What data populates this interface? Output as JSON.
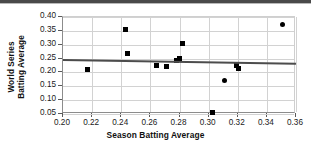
{
  "chart_data": {
    "type": "scatter",
    "title": "",
    "xlabel": "Season Batting Average",
    "ylabel": "World Series Batting Average",
    "ylabel_lines": [
      "World Series",
      "Batting Average"
    ],
    "xlim": [
      0.2,
      0.36
    ],
    "ylim": [
      0.05,
      0.4
    ],
    "xticks": [
      0.2,
      0.22,
      0.24,
      0.26,
      0.28,
      0.3,
      0.32,
      0.34,
      0.36
    ],
    "xtick_labels": [
      "0.20",
      "0.22",
      "0.24",
      "0.26",
      "0.28",
      "0.30",
      "0.32",
      "0.34",
      "0.36"
    ],
    "yticks": [
      0.05,
      0.1,
      0.15,
      0.2,
      0.25,
      0.3,
      0.35,
      0.4
    ],
    "ytick_labels": [
      "0.05",
      "0.10",
      "0.15",
      "0.20",
      "0.25",
      "0.30",
      "0.35",
      "0.40"
    ],
    "grid": true,
    "legend": false,
    "marker_color": "#000000",
    "trendline_color": "#4c4c4c",
    "points": [
      {
        "x": 0.2165,
        "y": 0.212,
        "marker": "square"
      },
      {
        "x": 0.243,
        "y": 0.356,
        "marker": "square"
      },
      {
        "x": 0.244,
        "y": 0.268,
        "marker": "square"
      },
      {
        "x": 0.2645,
        "y": 0.2245,
        "marker": "square"
      },
      {
        "x": 0.271,
        "y": 0.222,
        "marker": "square"
      },
      {
        "x": 0.278,
        "y": 0.243,
        "marker": "square"
      },
      {
        "x": 0.28,
        "y": 0.25,
        "marker": "square"
      },
      {
        "x": 0.282,
        "y": 0.303,
        "marker": "square"
      },
      {
        "x": 0.3025,
        "y": 0.055,
        "marker": "square"
      },
      {
        "x": 0.311,
        "y": 0.17,
        "marker": "circle"
      },
      {
        "x": 0.319,
        "y": 0.2245,
        "marker": "square"
      },
      {
        "x": 0.3205,
        "y": 0.2145,
        "marker": "square"
      },
      {
        "x": 0.351,
        "y": 0.372,
        "marker": "circle"
      }
    ],
    "trendline": {
      "x_start": 0.2,
      "y_start": 0.25,
      "x_end": 0.36,
      "y_end": 0.2365
    }
  }
}
